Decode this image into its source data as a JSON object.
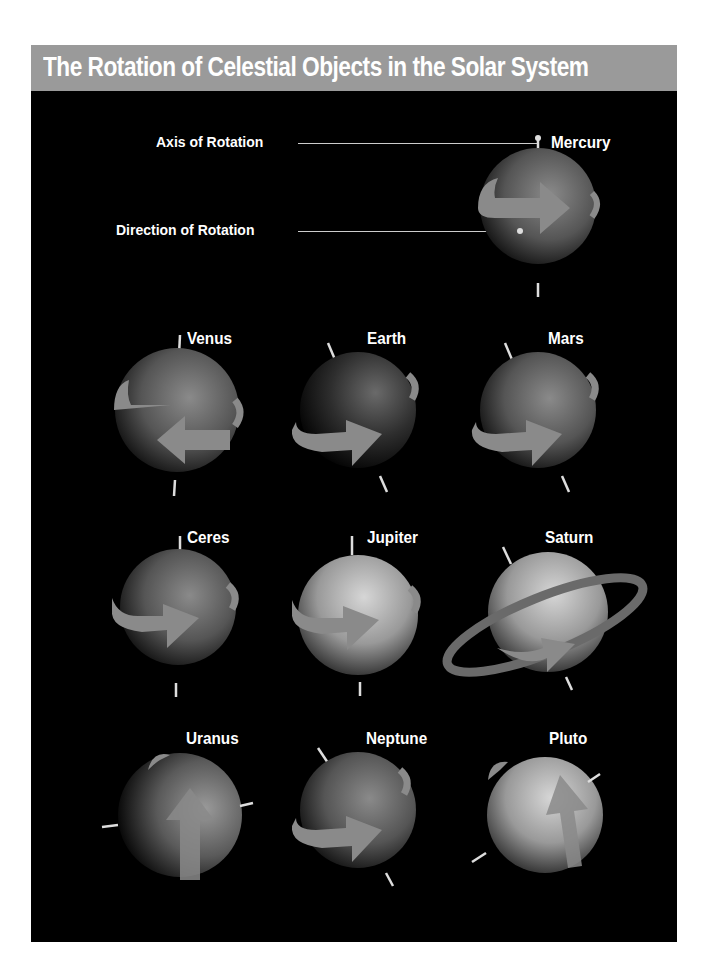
{
  "title": "The Rotation of Celestial Objects in the Solar System",
  "legend": {
    "axis_label": "Axis of Rotation",
    "direction_label": "Direction of Rotation"
  },
  "colors": {
    "background": "#000000",
    "title_bar": "#9a9a9a",
    "arrow": "#8a8a8a",
    "text": "#ffffff"
  },
  "objects": [
    {
      "name": "Mercury",
      "row": 0,
      "col": 2,
      "axis_tilt_deg": 0,
      "rotation": "prograde"
    },
    {
      "name": "Venus",
      "row": 1,
      "col": 0,
      "axis_tilt_deg": 3,
      "rotation": "retrograde"
    },
    {
      "name": "Earth",
      "row": 1,
      "col": 1,
      "axis_tilt_deg": 23,
      "rotation": "prograde"
    },
    {
      "name": "Mars",
      "row": 1,
      "col": 2,
      "axis_tilt_deg": 25,
      "rotation": "prograde"
    },
    {
      "name": "Ceres",
      "row": 2,
      "col": 0,
      "axis_tilt_deg": 4,
      "rotation": "prograde"
    },
    {
      "name": "Jupiter",
      "row": 2,
      "col": 1,
      "axis_tilt_deg": 3,
      "rotation": "prograde"
    },
    {
      "name": "Saturn",
      "row": 2,
      "col": 2,
      "axis_tilt_deg": 27,
      "rotation": "prograde",
      "rings": true
    },
    {
      "name": "Uranus",
      "row": 3,
      "col": 0,
      "axis_tilt_deg": 98,
      "rotation": "prograde"
    },
    {
      "name": "Neptune",
      "row": 3,
      "col": 1,
      "axis_tilt_deg": 28,
      "rotation": "prograde"
    },
    {
      "name": "Pluto",
      "row": 3,
      "col": 2,
      "axis_tilt_deg": 120,
      "rotation": "prograde"
    }
  ]
}
